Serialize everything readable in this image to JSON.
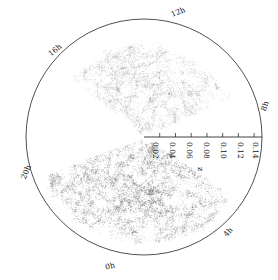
{
  "figure": {
    "name": "galaxy-redshift-survey-cone",
    "background_color": "#ffffff",
    "ink_color": "#222222"
  },
  "chart_data": {
    "type": "scatter",
    "title": "",
    "subtitle": "",
    "projection": "polar",
    "xlabel": "",
    "ylabel": "",
    "radial_axis": {
      "label": "z",
      "ticks": [
        0.02,
        0.04,
        0.06,
        0.08,
        0.1,
        0.12,
        0.14
      ],
      "tick_labels": [
        "0.02",
        "0.04",
        "0.06",
        "0.08",
        "0.10",
        "0.12",
        "0.14"
      ],
      "range": [
        0.0,
        0.15
      ],
      "direction": "right",
      "label_rotation_deg": 90
    },
    "angular_axis": {
      "label": "right ascension",
      "unit": "hours",
      "ticks": [
        0,
        4,
        8,
        12,
        16,
        20
      ],
      "tick_labels": [
        "0h",
        "4h",
        "8h",
        "12h",
        "16h",
        "20h"
      ],
      "zero_position": "bottom",
      "direction": "clockwise-from-bottom"
    },
    "legend": {
      "show": false,
      "position": "none"
    },
    "grid": false,
    "series": [
      {
        "name": "northern-galaxy-wedge",
        "marker": "point",
        "color": "#6b6b6b",
        "point_count": 6200,
        "ra_range_hours": [
          8.2,
          16.6
        ],
        "z_range": [
          0.004,
          0.135
        ],
        "description": "dense upper cosmic-web wedge"
      },
      {
        "name": "southern-galaxy-wedge",
        "marker": "point",
        "color": "#8a8a8a",
        "point_count": 3400,
        "ra_range_hours": [
          20.6,
          28.4
        ],
        "z_range": [
          0.004,
          0.118
        ],
        "description": "sparser lower cosmic-web wedge"
      }
    ],
    "gaps": [
      {
        "name": "survey-gap-wedge",
        "ra_range_hours": [
          16.8,
          20.4
        ]
      }
    ],
    "annotations": []
  },
  "circle": {
    "center_x": 144,
    "center_y": 137,
    "radius": 118,
    "stroke": "#3c3c3c",
    "stroke_width": 0.9
  },
  "axis": {
    "origin_x": 144,
    "origin_y": 137,
    "end_x": 262,
    "tick_length": 4,
    "stroke": "#2c2c2c"
  },
  "tick_items": [
    {
      "label": "0.02",
      "x": 160,
      "y": 142
    },
    {
      "label": "0.04",
      "x": 177,
      "y": 142
    },
    {
      "label": "0.06",
      "x": 194,
      "y": 142
    },
    {
      "label": "0.08",
      "x": 211,
      "y": 142
    },
    {
      "label": "0.10",
      "x": 228,
      "y": 142
    },
    {
      "label": "0.12",
      "x": 245,
      "y": 142
    },
    {
      "label": "0.14",
      "x": 260,
      "y": 142
    }
  ],
  "axis_title": {
    "label": "z",
    "x": 206,
    "y": 167
  },
  "hour_items": [
    {
      "label": "12h",
      "x": 178,
      "y": 12,
      "rotate": -22
    },
    {
      "label": "16h",
      "x": 55,
      "y": 50,
      "rotate": -40
    },
    {
      "label": "20h",
      "x": 26,
      "y": 172,
      "rotate": -68
    },
    {
      "label": "0h",
      "x": 110,
      "y": 266,
      "rotate": -16
    },
    {
      "label": "4h",
      "x": 228,
      "y": 232,
      "rotate": -50
    },
    {
      "label": "8h",
      "x": 265,
      "y": 106,
      "rotate": -72
    }
  ]
}
